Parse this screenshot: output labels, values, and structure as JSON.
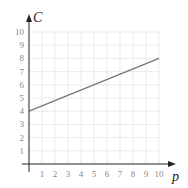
{
  "chart_data": {
    "type": "line",
    "title": "",
    "xlabel": "p",
    "ylabel": "C",
    "xlim": [
      0,
      10
    ],
    "ylim": [
      0,
      10
    ],
    "grid": true,
    "x_ticks": [
      "1",
      "2",
      "3",
      "4",
      "5",
      "6",
      "7",
      "8",
      "9",
      "10"
    ],
    "y_ticks": [
      "1",
      "2",
      "3",
      "4",
      "5",
      "6",
      "7",
      "8",
      "9",
      "10"
    ],
    "series": [
      {
        "name": "C",
        "x": [
          0,
          10
        ],
        "values": [
          4,
          8
        ],
        "color": "#777777"
      }
    ]
  }
}
